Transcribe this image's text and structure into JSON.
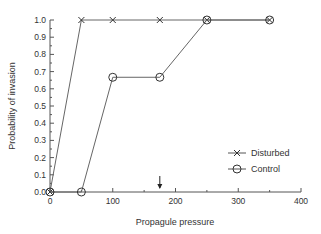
{
  "chart_data": {
    "type": "line",
    "title": "",
    "xlabel": "Propagule pressure",
    "ylabel": "Probability of invasion",
    "xlim": [
      0,
      400
    ],
    "ylim": [
      0,
      1.0
    ],
    "x_ticks": [
      0,
      100,
      200,
      300,
      400
    ],
    "y_ticks": [
      "0.0",
      "0.1",
      "0.2",
      "0.3",
      "0.4",
      "0.5",
      "0.6",
      "0.7",
      "0.8",
      "0.9",
      "1.0"
    ],
    "grid": false,
    "legend_position": "lower right",
    "series": [
      {
        "name": "Disturbed",
        "marker": "x",
        "x": [
          0,
          50,
          100,
          175,
          250,
          350
        ],
        "y": [
          0.0,
          1.0,
          1.0,
          1.0,
          1.0,
          1.0
        ]
      },
      {
        "name": "Control",
        "marker": "o",
        "x": [
          0,
          50,
          100,
          175,
          250,
          350
        ],
        "y": [
          0.0,
          0.0,
          0.667,
          0.667,
          1.0,
          1.0
        ]
      }
    ],
    "annotations": [
      {
        "type": "arrow",
        "x": 175,
        "direction": "down"
      }
    ]
  }
}
